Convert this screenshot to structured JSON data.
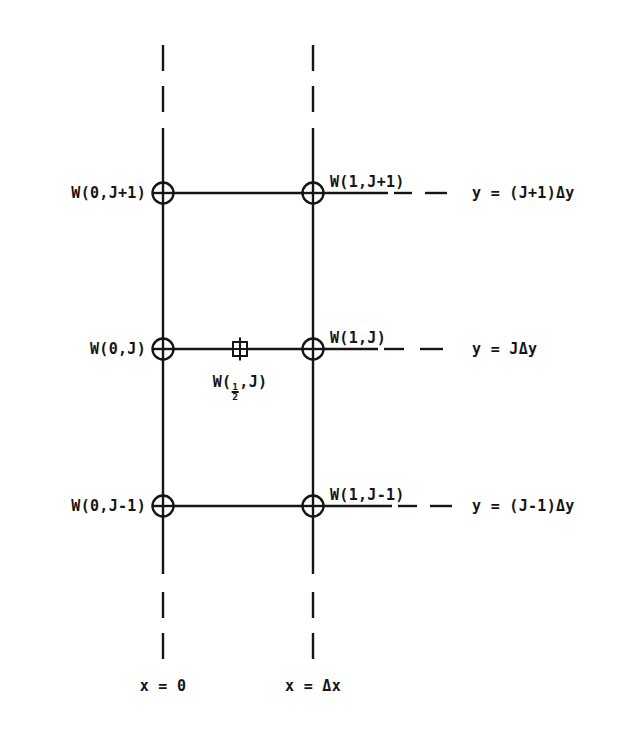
{
  "figure": {
    "kind": "finite-difference-grid-stencil",
    "background_color": "#ffffff",
    "line_color": "#151515",
    "text_color": "#151515"
  },
  "columns": [
    {
      "id": "x0",
      "axis_label": "x = 0",
      "x": 163
    },
    {
      "id": "xdx",
      "axis_label": "x = Δx",
      "x": 313
    }
  ],
  "rows": [
    {
      "id": "jp1",
      "y": 193,
      "left_label": "W(0,J+1)",
      "right_label": "W(1,J+1)",
      "y_value_label": "y = (J+1)Δy"
    },
    {
      "id": "j",
      "y": 349,
      "left_label": "W(0,J)",
      "right_label": "W(1,J)",
      "y_value_label": "y = JΔy"
    },
    {
      "id": "jm1",
      "y": 506,
      "left_label": "W(0,J-1)",
      "right_label": "W(1,J-1)",
      "y_value_label": "y = (J-1)Δy"
    }
  ],
  "midpoint_marker": {
    "label_prefix": "W(",
    "fraction_numerator": "1",
    "fraction_denominator": "2",
    "label_suffix": ",J)",
    "marker_name": "crossed-square",
    "x": 240,
    "y": 349
  },
  "node_marker_name": "crossed-circle",
  "node_count": 6
}
